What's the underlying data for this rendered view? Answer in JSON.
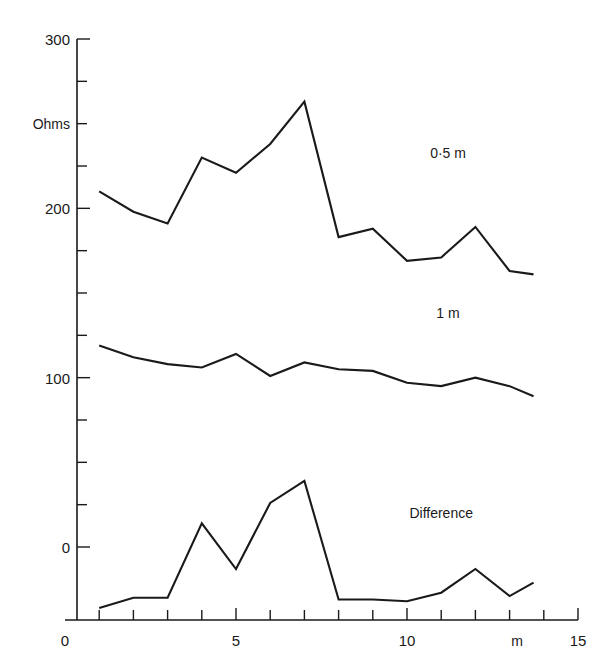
{
  "chart_data": {
    "type": "line",
    "title": "",
    "xlabel": "m",
    "ylabel": "Ohms",
    "xlim": [
      0,
      15
    ],
    "ylim": [
      -50,
      300
    ],
    "grid": false,
    "legend_position": "inline-annotation",
    "x_ticks_major": [
      0,
      5,
      10,
      15
    ],
    "x_tick_labels": [
      "0",
      "5",
      "10",
      "15"
    ],
    "x_ticks_minor": [
      1,
      2,
      3,
      4,
      6,
      7,
      8,
      9,
      11,
      12,
      13,
      14
    ],
    "y_ticks_major": [
      0,
      100,
      200,
      300
    ],
    "y_tick_labels": [
      "0",
      "100",
      "200",
      "300"
    ],
    "y_ticks_minor": [
      25,
      50,
      75,
      125,
      150,
      175,
      225,
      250,
      275
    ],
    "x": [
      1,
      2,
      3,
      4,
      5,
      6,
      7,
      8,
      9,
      10,
      11,
      12,
      13,
      13.7
    ],
    "series": [
      {
        "name": "0·5 m",
        "label": "0·5 m",
        "color": "#1a1a1a",
        "values": [
          210,
          198,
          191,
          230,
          221,
          238,
          263,
          183,
          188,
          169,
          171,
          189,
          163,
          161
        ]
      },
      {
        "name": "1 m",
        "label": "1 m",
        "color": "#1a1a1a",
        "values": [
          119,
          112,
          108,
          106,
          114,
          101,
          109,
          105,
          104,
          97,
          95,
          100,
          95,
          89
        ]
      },
      {
        "name": "Difference",
        "label": "Difference",
        "color": "#1a1a1a",
        "values": [
          -36,
          -30,
          -30,
          14,
          -13,
          26,
          39,
          -31,
          -31,
          -32,
          -27,
          -13,
          -29,
          -21
        ]
      }
    ],
    "annotations": [
      {
        "text": "0·5 m",
        "x": 11.2,
        "y": 230
      },
      {
        "text": "1 m",
        "x": 11.2,
        "y": 135
      },
      {
        "text": "Difference",
        "x": 11.0,
        "y": 17
      }
    ]
  },
  "axis": {
    "y_axis_title": "Ohms",
    "x_axis_unit": "m"
  }
}
